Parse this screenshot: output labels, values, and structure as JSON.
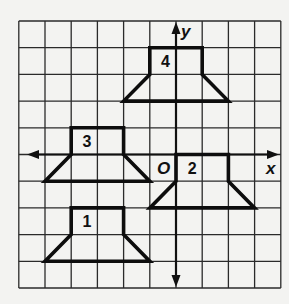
{
  "diagram": {
    "type": "coordinate-grid-transformations",
    "grid": {
      "x_min": -6,
      "x_max": 4,
      "y_min": -5,
      "y_max": 5,
      "origin_px": [
        176,
        154.5
      ],
      "unit_px_x": 26.2,
      "unit_px_y": 26.7
    },
    "axes": {
      "x_label": "x",
      "y_label": "y",
      "origin_label": "O"
    },
    "figures": [
      {
        "id": "1",
        "label": "1",
        "vertices": [
          [
            -4,
            -2
          ],
          [
            -2,
            -2
          ],
          [
            -2,
            -3
          ],
          [
            -1,
            -4
          ],
          [
            -5,
            -4
          ],
          [
            -4,
            -3
          ]
        ],
        "label_pos": [
          -3.4,
          -2.5
        ]
      },
      {
        "id": "2",
        "label": "2",
        "vertices": [
          [
            0,
            0
          ],
          [
            2,
            0
          ],
          [
            2,
            -1
          ],
          [
            3,
            -2
          ],
          [
            -1,
            -2
          ],
          [
            0,
            -1
          ]
        ],
        "label_pos": [
          0.62,
          -0.5
        ]
      },
      {
        "id": "3",
        "label": "3",
        "vertices": [
          [
            -4,
            1
          ],
          [
            -2,
            1
          ],
          [
            -2,
            0
          ],
          [
            -1,
            -1
          ],
          [
            -5,
            -1
          ],
          [
            -4,
            0
          ]
        ],
        "label_pos": [
          -3.4,
          0.5
        ]
      },
      {
        "id": "4",
        "label": "4",
        "vertices": [
          [
            -1,
            4
          ],
          [
            1,
            4
          ],
          [
            1,
            3
          ],
          [
            2,
            2
          ],
          [
            -2,
            2
          ],
          [
            -1,
            3
          ]
        ],
        "label_pos": [
          -0.4,
          3.5
        ]
      }
    ],
    "colors": {
      "background": "#f3f3f1",
      "grid": "#2a2a2a",
      "figure_stroke": "#0d0d0d",
      "text": "#111111"
    }
  }
}
